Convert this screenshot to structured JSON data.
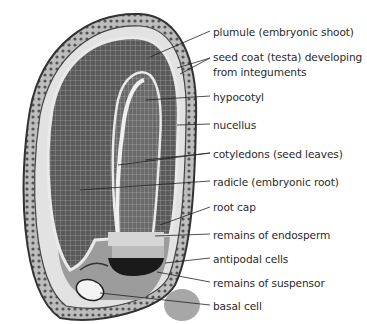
{
  "figure": {
    "labels": [
      {
        "id": "plumule",
        "text": "plumule (embryonic shoot)",
        "y": 26
      },
      {
        "id": "seed-coat-1",
        "text": "seed coat (testa) developing",
        "y": 51
      },
      {
        "id": "seed-coat-2",
        "text": "from integuments",
        "y": 67
      },
      {
        "id": "hypocotyl",
        "text": "hypocotyl",
        "y": 91
      },
      {
        "id": "nucellus",
        "text": "nucellus",
        "y": 119
      },
      {
        "id": "cotyledons",
        "text": "cotyledons (seed leaves)",
        "y": 148
      },
      {
        "id": "radicle",
        "text": "radicle (embryonic root)",
        "y": 176
      },
      {
        "id": "root-cap",
        "text": "root cap",
        "y": 201
      },
      {
        "id": "endosperm",
        "text": "remains of endosperm",
        "y": 229
      },
      {
        "id": "antipodal",
        "text": "antipodal cells",
        "y": 253
      },
      {
        "id": "suspensor",
        "text": "remains of suspensor",
        "y": 277
      },
      {
        "id": "basal-cell",
        "text": "basal cell",
        "y": 300
      }
    ],
    "colors": {
      "text": "#2a2a2a",
      "line": "#222222",
      "tissue_dark": "#4a4a4a",
      "tissue_mid": "#7a7a7a",
      "tissue_light": "#c8c8c8",
      "background": "#ffffff"
    }
  }
}
